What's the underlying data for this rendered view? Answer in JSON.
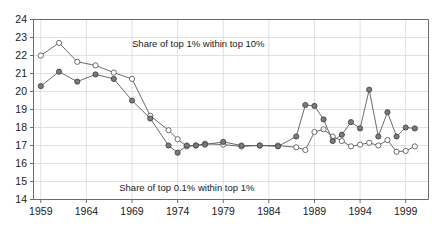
{
  "chart_data": {
    "type": "line",
    "title": "",
    "xlabel": "",
    "ylabel": "",
    "xlim": [
      1958.2,
      2001.5
    ],
    "ylim": [
      14,
      24
    ],
    "grid": true,
    "legend_position": "inline-annotation",
    "x_ticks": [
      1959,
      1964,
      1969,
      1974,
      1979,
      1984,
      1989,
      1994,
      1999
    ],
    "y_ticks": [
      14,
      15,
      16,
      17,
      18,
      19,
      20,
      21,
      22,
      23,
      24
    ],
    "annotations": [
      {
        "text": "Share of top 1% within top 10%",
        "x": 1969.0,
        "y": 22.45
      },
      {
        "text": "Share of top 0.1% within top 1%",
        "x": 1967.6,
        "y": 14.45
      }
    ],
    "series": [
      {
        "name": "Share of top 1% within top 10%",
        "marker": "open-circle",
        "x": [
          1959,
          1961,
          1963,
          1965,
          1967,
          1969,
          1971,
          1973,
          1974,
          1975,
          1976,
          1977,
          1979,
          1981,
          1983,
          1985,
          1987,
          1988,
          1989,
          1990,
          1991,
          1992,
          1993,
          1994,
          1995,
          1996,
          1997,
          1998,
          1999,
          2000
        ],
        "values": [
          22.0,
          22.7,
          21.65,
          21.45,
          21.05,
          20.7,
          18.65,
          17.85,
          17.35,
          16.95,
          17.0,
          17.1,
          17.05,
          16.95,
          17.0,
          17.0,
          16.9,
          16.75,
          17.75,
          17.9,
          17.5,
          17.25,
          16.95,
          17.05,
          17.15,
          17.0,
          17.3,
          16.65,
          16.7,
          16.95
        ]
      },
      {
        "name": "Share of top 0.1% within top 1%",
        "marker": "filled-circle",
        "x": [
          1959,
          1961,
          1963,
          1965,
          1967,
          1969,
          1971,
          1973,
          1974,
          1975,
          1976,
          1977,
          1979,
          1981,
          1983,
          1985,
          1987,
          1988,
          1989,
          1990,
          1991,
          1992,
          1993,
          1994,
          1995,
          1996,
          1997,
          1998,
          1999,
          2000
        ],
        "values": [
          20.3,
          21.1,
          20.55,
          20.95,
          20.7,
          19.5,
          18.5,
          17.0,
          16.6,
          17.0,
          17.0,
          17.05,
          17.2,
          17.0,
          17.0,
          16.95,
          17.5,
          19.25,
          19.2,
          18.45,
          17.25,
          17.6,
          18.3,
          17.95,
          20.1,
          17.5,
          18.85,
          17.5,
          18.0,
          17.95
        ]
      }
    ]
  }
}
